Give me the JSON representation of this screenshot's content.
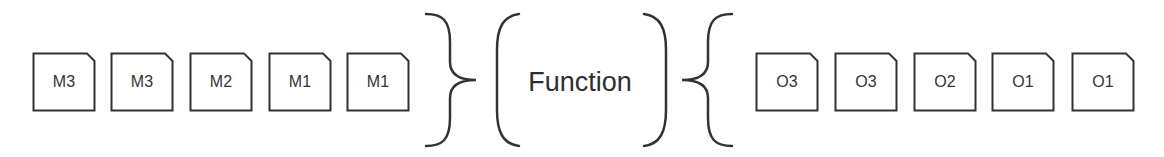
{
  "diagram": {
    "type": "input-function-output",
    "stroke_color": "#333333",
    "inputs": [
      {
        "label": "M3",
        "x": 32
      },
      {
        "label": "M3",
        "x": 110
      },
      {
        "label": "M2",
        "x": 189
      },
      {
        "label": "M1",
        "x": 268
      },
      {
        "label": "M1",
        "x": 346
      }
    ],
    "function": {
      "label": "Function"
    },
    "outputs": [
      {
        "label": "O3",
        "x": 755
      },
      {
        "label": "O3",
        "x": 834
      },
      {
        "label": "O2",
        "x": 913
      },
      {
        "label": "O1",
        "x": 991
      },
      {
        "label": "O1",
        "x": 1071
      }
    ]
  }
}
